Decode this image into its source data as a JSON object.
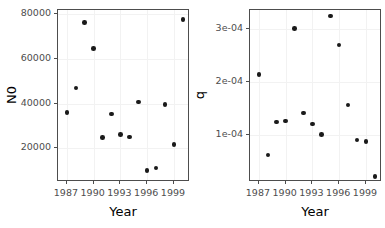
{
  "figure": {
    "background_color": "#ffffff",
    "point_color": "#1a1a1a",
    "panel_border_color": "#4d4d4d",
    "grid_color": "#f2f2f2"
  },
  "chart_data": [
    {
      "type": "scatter",
      "title": "",
      "xlabel": "Year",
      "ylabel": "N0",
      "xlim": [
        1986.0,
        2000.8
      ],
      "ylim": [
        5000,
        82000
      ],
      "xticks": [
        1987,
        1990,
        1993,
        1996,
        1999
      ],
      "xticklabels": [
        "1987",
        "1990",
        "1993",
        "1996",
        "1999"
      ],
      "yticks": [
        20000,
        40000,
        60000,
        80000
      ],
      "yticklabels": [
        "20000",
        "40000",
        "60000",
        "80000"
      ],
      "grid": true,
      "legend": "none",
      "x": [
        1987,
        1988,
        1989,
        1990,
        1991,
        1992,
        1993,
        1994,
        1995,
        1996,
        1997,
        1998,
        1999,
        2000
      ],
      "y": [
        36000,
        47000,
        76500,
        64800,
        25000,
        35500,
        26200,
        25200,
        40800,
        10200,
        11200,
        39700,
        21700,
        77700
      ],
      "points": [
        {
          "x": 1987,
          "y": 36000
        },
        {
          "x": 1988,
          "y": 47000
        },
        {
          "x": 1989,
          "y": 76500
        },
        {
          "x": 1990,
          "y": 64800
        },
        {
          "x": 1991,
          "y": 25000
        },
        {
          "x": 1992,
          "y": 35500
        },
        {
          "x": 1993,
          "y": 26200
        },
        {
          "x": 1994,
          "y": 25200
        },
        {
          "x": 1995,
          "y": 40800
        },
        {
          "x": 1996,
          "y": 10200
        },
        {
          "x": 1997,
          "y": 11200
        },
        {
          "x": 1998,
          "y": 39700
        },
        {
          "x": 1999,
          "y": 21700
        },
        {
          "x": 2000,
          "y": 77700
        }
      ]
    },
    {
      "type": "scatter",
      "title": "",
      "xlabel": "Year",
      "ylabel": "q",
      "xlim": [
        1986.0,
        2000.8
      ],
      "ylim": [
        1.2e-05,
        0.000336
      ],
      "xticks": [
        1987,
        1990,
        1993,
        1996,
        1999
      ],
      "xticklabels": [
        "1987",
        "1990",
        "1993",
        "1996",
        "1999"
      ],
      "yticks": [
        0.0001,
        0.0002,
        0.0003
      ],
      "yticklabels": [
        "1e-04",
        "2e-04",
        "3e-04"
      ],
      "grid": true,
      "legend": "none",
      "x": [
        1987,
        1988,
        1989,
        1990,
        1991,
        1992,
        1993,
        1994,
        1995,
        1996,
        1997,
        1998,
        1999,
        2000
      ],
      "y": [
        0.000215,
        6.3e-05,
        0.000125,
        0.000127,
        0.000301,
        0.000142,
        0.000121,
        0.000102,
        0.000325,
        0.00027,
        0.000157,
        9.1e-05,
        8.8e-05,
        2.2e-05
      ],
      "points": [
        {
          "x": 1987,
          "y": 0.000215
        },
        {
          "x": 1988,
          "y": 6.3e-05
        },
        {
          "x": 1989,
          "y": 0.000125
        },
        {
          "x": 1990,
          "y": 0.000127
        },
        {
          "x": 1991,
          "y": 0.000301
        },
        {
          "x": 1992,
          "y": 0.000142
        },
        {
          "x": 1993,
          "y": 0.000121
        },
        {
          "x": 1994,
          "y": 0.000102
        },
        {
          "x": 1995,
          "y": 0.000325
        },
        {
          "x": 1996,
          "y": 0.00027
        },
        {
          "x": 1997,
          "y": 0.000157
        },
        {
          "x": 1998,
          "y": 9.1e-05
        },
        {
          "x": 1999,
          "y": 8.8e-05
        },
        {
          "x": 2000,
          "y": 2.2e-05
        }
      ]
    }
  ]
}
